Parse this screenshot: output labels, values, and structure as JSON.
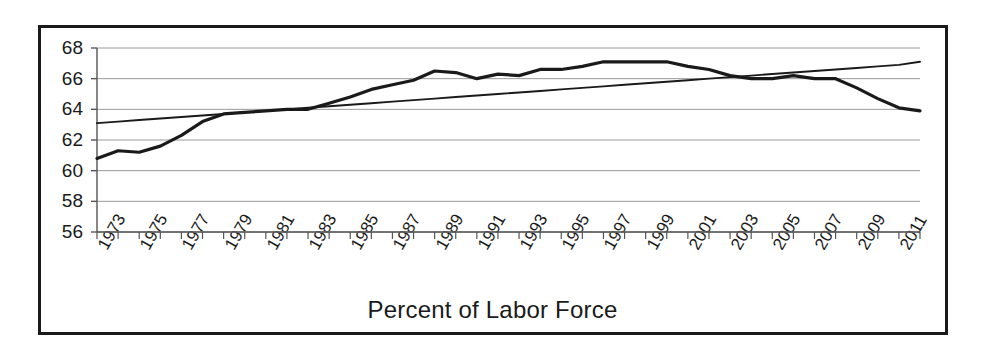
{
  "chart_data": {
    "type": "line",
    "title": "",
    "subtitle": "",
    "xlabel": "Percent of Labor Force",
    "ylabel": "",
    "xlim": [
      1973,
      2012
    ],
    "ylim": [
      56,
      68
    ],
    "grid": true,
    "grid_axis": "y",
    "legend": false,
    "legend_position": "none",
    "ytick_labels": [
      "68",
      "66",
      "64",
      "62",
      "60",
      "58",
      "56"
    ],
    "ytick_values": [
      68,
      66,
      64,
      62,
      60,
      58,
      56
    ],
    "xtick_labels": [
      "1973",
      "1975",
      "1977",
      "1979",
      "1981",
      "1983",
      "1985",
      "1987",
      "1989",
      "1991",
      "1993",
      "1995",
      "1997",
      "1999",
      "2001",
      "2003",
      "2005",
      "2007",
      "2009",
      "2011"
    ],
    "xtick_values": [
      1973,
      1975,
      1977,
      1979,
      1981,
      1983,
      1985,
      1987,
      1989,
      1991,
      1993,
      1995,
      1997,
      1999,
      2001,
      2003,
      2005,
      2007,
      2009,
      2011
    ],
    "x": [
      1973,
      1974,
      1975,
      1976,
      1977,
      1978,
      1979,
      1980,
      1981,
      1982,
      1983,
      1984,
      1985,
      1986,
      1987,
      1988,
      1989,
      1990,
      1991,
      1992,
      1993,
      1994,
      1995,
      1996,
      1997,
      1998,
      1999,
      2000,
      2001,
      2002,
      2003,
      2004,
      2005,
      2006,
      2007,
      2008,
      2009,
      2010,
      2011,
      2012
    ],
    "series": [
      {
        "name": "Labor force participation rate",
        "style": "thick-solid",
        "color": "#1a1a1a",
        "values": [
          60.8,
          61.3,
          61.2,
          61.6,
          62.3,
          63.2,
          63.7,
          63.8,
          63.9,
          64.0,
          64.0,
          64.4,
          64.8,
          65.3,
          65.6,
          65.9,
          66.5,
          66.4,
          66.0,
          66.3,
          66.2,
          66.6,
          66.6,
          66.8,
          67.1,
          67.1,
          67.1,
          67.1,
          66.8,
          66.6,
          66.2,
          66.0,
          66.0,
          66.2,
          66.0,
          66.0,
          65.4,
          64.7,
          64.1,
          63.9
        ]
      },
      {
        "name": "Linear trend",
        "style": "thin-solid",
        "color": "#1a1a1a",
        "values": [
          63.1,
          63.2,
          63.3,
          63.4,
          63.5,
          63.6,
          63.7,
          63.8,
          63.9,
          64.0,
          64.1,
          64.2,
          64.3,
          64.4,
          64.5,
          64.6,
          64.7,
          64.8,
          64.9,
          65.0,
          65.1,
          65.2,
          65.3,
          65.4,
          65.5,
          65.6,
          65.7,
          65.8,
          65.9,
          66.0,
          66.1,
          66.2,
          66.3,
          66.4,
          66.5,
          66.6,
          66.7,
          66.8,
          66.9,
          67.1
        ]
      }
    ],
    "annotations": []
  },
  "colors": {
    "frame": "#1a1a1a",
    "gridline": "#9a9a9a",
    "axis": "#555555",
    "data_line": "#1a1a1a",
    "background": "#ffffff"
  }
}
